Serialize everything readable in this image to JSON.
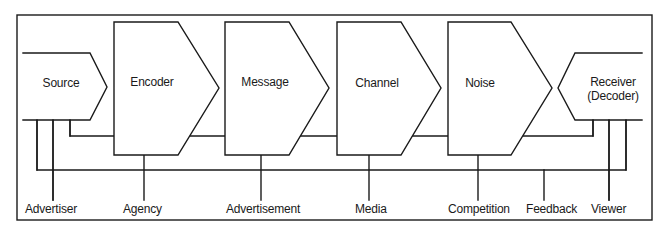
{
  "diagram": {
    "title": "",
    "nodes": [
      {
        "id": "source",
        "label": "Source",
        "label2": ""
      },
      {
        "id": "encoder",
        "label": "Encoder",
        "label2": ""
      },
      {
        "id": "message",
        "label": "Message",
        "label2": ""
      },
      {
        "id": "channel",
        "label": "Channel",
        "label2": ""
      },
      {
        "id": "noise",
        "label": "Noise",
        "label2": ""
      },
      {
        "id": "receiver",
        "label": "Receiver",
        "label2": "(Decoder)"
      }
    ],
    "bottom_labels": [
      {
        "id": "advertiser",
        "label": "Advertiser",
        "connects_to": "source"
      },
      {
        "id": "agency",
        "label": "Agency",
        "connects_to": "encoder"
      },
      {
        "id": "advertisement",
        "label": "Advertisement",
        "connects_to": "message"
      },
      {
        "id": "media",
        "label": "Media",
        "connects_to": "channel"
      },
      {
        "id": "competition",
        "label": "Competition",
        "connects_to": "noise"
      },
      {
        "id": "feedback",
        "label": "Feedback",
        "connects_to": "feedback-loop"
      },
      {
        "id": "viewer",
        "label": "Viewer",
        "connects_to": "receiver"
      }
    ],
    "edges": [
      {
        "from": "source",
        "to": "encoder"
      },
      {
        "from": "encoder",
        "to": "message"
      },
      {
        "from": "message",
        "to": "channel"
      },
      {
        "from": "channel",
        "to": "noise"
      },
      {
        "from": "noise",
        "to": "receiver"
      },
      {
        "from": "receiver",
        "to": "source",
        "type": "feedback"
      }
    ],
    "colors": {
      "stroke": "#1a1a1a",
      "background": "#ffffff"
    }
  }
}
